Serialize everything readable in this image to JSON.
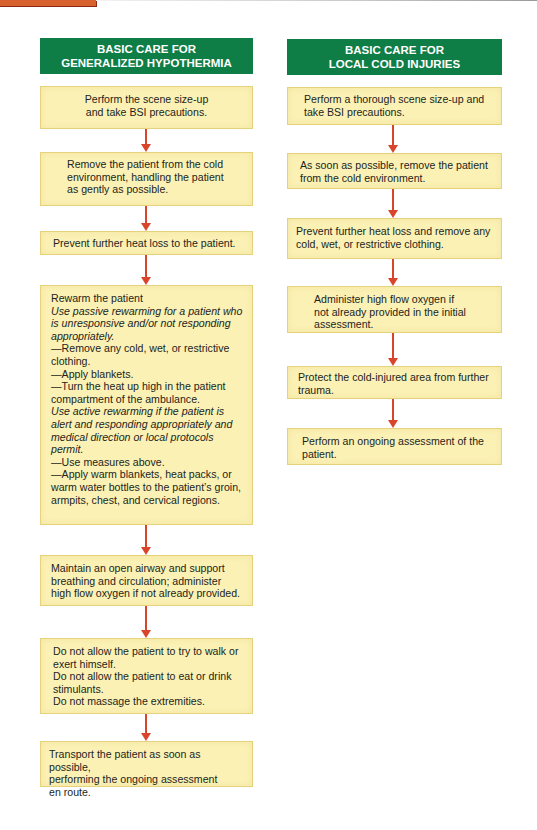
{
  "colors": {
    "header_green": "#0f7d46",
    "box_fill": "#fbf1b5",
    "box_border": "#e5d27a",
    "arrow_red": "#d9452b",
    "top_tab_orange": "#d8622f"
  },
  "left": {
    "title_line1": "BASIC CARE FOR",
    "title_line2": "GENERALIZED HYPOTHERMIA",
    "steps": [
      {
        "lines": [
          "Perform the scene size-up",
          "and take BSI precautions."
        ]
      },
      {
        "lines": [
          "Remove the patient from the cold",
          "environment, handling the patient",
          "as gently as possible."
        ]
      },
      {
        "lines": [
          "Prevent further heat loss to the patient."
        ]
      },
      {
        "heading": "Rewarm the patient",
        "passive_note": "Use passive rewarming for a patient who is unresponsive and/or not responding appropriately.",
        "passive_items": [
          "—Remove any cold, wet, or restrictive clothing.",
          "—Apply blankets.",
          "—Turn the heat up high in the patient compartment of the ambulance."
        ],
        "active_note": "Use active rewarming if the patient is alert and responding appropriately and medical direction or local protocols permit.",
        "active_items": [
          "—Use measures above.",
          "—Apply warm blankets, heat packs, or warm water bottles to the patient’s groin, armpits, chest, and cervical regions."
        ]
      },
      {
        "lines": [
          "Maintain an open airway and support breathing and circulation; administer high flow oxygen if not already provided."
        ]
      },
      {
        "lines": [
          "Do not allow the patient to try to walk or exert himself.",
          "Do not allow the patient to eat or drink stimulants.",
          "Do not massage the extremities."
        ]
      },
      {
        "lines": [
          "Transport the patient as soon as possible,",
          "performing the ongoing assessment",
          "en route."
        ]
      }
    ]
  },
  "right": {
    "title_line1": "BASIC CARE FOR",
    "title_line2": "LOCAL COLD INJURIES",
    "steps": [
      {
        "lines": [
          "Perform a thorough scene size-up and take BSI precautions."
        ]
      },
      {
        "lines": [
          "As soon as possible, remove the patient from the cold environment."
        ]
      },
      {
        "lines": [
          "Prevent further heat loss and remove any cold, wet, or restrictive clothing."
        ]
      },
      {
        "lines": [
          "Administer high flow oxygen if not already provided in the initial assessment."
        ]
      },
      {
        "lines": [
          "Protect the cold-injured area from further trauma."
        ]
      },
      {
        "lines": [
          "Perform an ongoing assessment of the patient."
        ]
      }
    ]
  }
}
